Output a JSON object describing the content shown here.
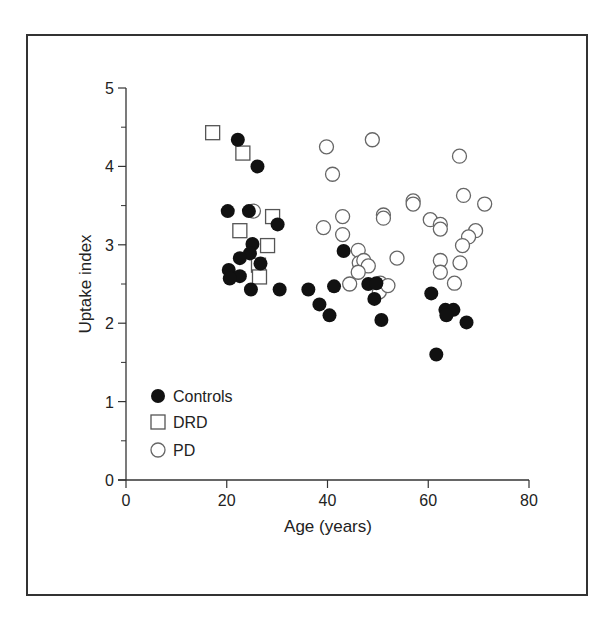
{
  "chart_data": {
    "type": "scatter",
    "title": "",
    "xlabel": "Age (years)",
    "ylabel": "Uptake index",
    "xlim": [
      0,
      80
    ],
    "ylim": [
      0,
      5
    ],
    "xticks": [
      0,
      20,
      40,
      60,
      80
    ],
    "yticks": [
      0,
      1,
      2,
      3,
      4,
      5
    ],
    "yminor_ticks": [
      0.5,
      1.5,
      2.5,
      3.5,
      4.5
    ],
    "grid": false,
    "legend_position": "lower-left-inside",
    "legend": [
      {
        "name": "Controls",
        "marker": "filled-circle"
      },
      {
        "name": "DRD",
        "marker": "open-square"
      },
      {
        "name": "PD",
        "marker": "open-circle"
      }
    ],
    "series": [
      {
        "name": "Controls",
        "marker": "filled-circle",
        "points": [
          [
            22.2,
            4.34
          ],
          [
            26.1,
            4.0
          ],
          [
            20.2,
            3.43
          ],
          [
            24.4,
            3.43
          ],
          [
            30.1,
            3.26
          ],
          [
            25.1,
            3.01
          ],
          [
            24.6,
            2.89
          ],
          [
            22.6,
            2.83
          ],
          [
            26.7,
            2.76
          ],
          [
            20.4,
            2.68
          ],
          [
            22.6,
            2.6
          ],
          [
            20.6,
            2.57
          ],
          [
            24.8,
            2.43
          ],
          [
            30.5,
            2.43
          ],
          [
            43.2,
            2.92
          ],
          [
            36.2,
            2.43
          ],
          [
            41.3,
            2.47
          ],
          [
            38.4,
            2.24
          ],
          [
            40.4,
            2.1
          ],
          [
            48.1,
            2.5
          ],
          [
            49.7,
            2.51
          ],
          [
            49.3,
            2.31
          ],
          [
            50.7,
            2.04
          ],
          [
            60.6,
            2.38
          ],
          [
            63.4,
            2.17
          ],
          [
            65.0,
            2.17
          ],
          [
            63.6,
            2.1
          ],
          [
            67.6,
            2.01
          ],
          [
            61.6,
            1.6
          ]
        ]
      },
      {
        "name": "DRD",
        "marker": "open-square",
        "points": [
          [
            17.2,
            4.43
          ],
          [
            23.2,
            4.17
          ],
          [
            29.1,
            3.36
          ],
          [
            22.6,
            3.18
          ],
          [
            28.1,
            2.99
          ],
          [
            26.3,
            2.74
          ],
          [
            26.5,
            2.59
          ]
        ]
      },
      {
        "name": "PD",
        "marker": "open-circle",
        "points": [
          [
            25.3,
            3.43
          ],
          [
            39.8,
            4.25
          ],
          [
            48.9,
            4.34
          ],
          [
            41.0,
            3.9
          ],
          [
            43.0,
            3.36
          ],
          [
            39.2,
            3.22
          ],
          [
            43.0,
            3.13
          ],
          [
            51.1,
            3.38
          ],
          [
            51.1,
            3.34
          ],
          [
            57.0,
            3.56
          ],
          [
            57.0,
            3.52
          ],
          [
            46.1,
            2.93
          ],
          [
            53.8,
            2.83
          ],
          [
            46.3,
            2.77
          ],
          [
            47.2,
            2.8
          ],
          [
            48.1,
            2.73
          ],
          [
            46.1,
            2.65
          ],
          [
            44.4,
            2.5
          ],
          [
            50.5,
            2.51
          ],
          [
            50.3,
            2.4
          ],
          [
            52.0,
            2.48
          ],
          [
            66.2,
            4.13
          ],
          [
            67.0,
            3.63
          ],
          [
            71.2,
            3.52
          ],
          [
            60.4,
            3.32
          ],
          [
            62.4,
            3.26
          ],
          [
            62.4,
            3.2
          ],
          [
            69.4,
            3.18
          ],
          [
            68.0,
            3.1
          ],
          [
            66.8,
            2.99
          ],
          [
            62.4,
            2.8
          ],
          [
            66.3,
            2.77
          ],
          [
            62.4,
            2.65
          ],
          [
            65.2,
            2.51
          ]
        ]
      }
    ]
  },
  "labels": {
    "xlabel": "Age (years)",
    "ylabel": "Uptake index",
    "legend": [
      "Controls",
      "DRD",
      "PD"
    ]
  }
}
